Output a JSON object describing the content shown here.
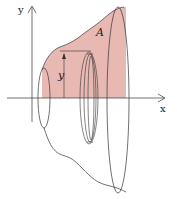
{
  "diagram": {
    "labels": {
      "y_axis": "y",
      "x_axis": "x",
      "region": "A",
      "radius": "y"
    },
    "colors": {
      "region_fill": "#e8b9b3",
      "stroke": "#333333",
      "background": "#ffffff"
    }
  }
}
